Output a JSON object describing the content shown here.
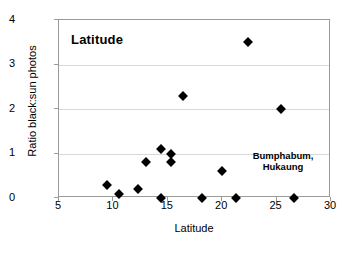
{
  "chart_data": {
    "type": "scatter",
    "title": "Latitude",
    "xlabel": "Latitude",
    "ylabel": "Ratio black:sun photos",
    "xlim": [
      5,
      30
    ],
    "ylim": [
      0,
      4
    ],
    "xticks": [
      5,
      10,
      15,
      20,
      25,
      30
    ],
    "yticks": [
      0,
      1,
      2,
      3,
      4
    ],
    "grid": "horizontal",
    "legend": "none",
    "marker": "filled-diamond",
    "marker_color": "#000000",
    "annotations": [
      {
        "text_line1": "Bumphabum,",
        "text_line2": "Hukaung",
        "x": 26.0,
        "y": 0.55
      }
    ],
    "points": [
      {
        "x": 9.4,
        "y": 0.3
      },
      {
        "x": 10.5,
        "y": 0.08
      },
      {
        "x": 12.3,
        "y": 0.2
      },
      {
        "x": 13.0,
        "y": 0.8
      },
      {
        "x": 14.4,
        "y": 1.1
      },
      {
        "x": 14.4,
        "y": 0.0
      },
      {
        "x": 15.3,
        "y": 1.0
      },
      {
        "x": 15.3,
        "y": 0.8
      },
      {
        "x": 16.4,
        "y": 2.3
      },
      {
        "x": 18.1,
        "y": 0.0
      },
      {
        "x": 20.0,
        "y": 0.6
      },
      {
        "x": 21.3,
        "y": 0.0
      },
      {
        "x": 22.4,
        "y": 3.5
      },
      {
        "x": 25.4,
        "y": 2.0
      },
      {
        "x": 26.6,
        "y": 0.0
      }
    ]
  },
  "axis": {
    "x_tick_labels": [
      "5",
      "10",
      "15",
      "20",
      "25",
      "30"
    ],
    "y_tick_labels": [
      "0",
      "1",
      "2",
      "3",
      "4"
    ]
  }
}
